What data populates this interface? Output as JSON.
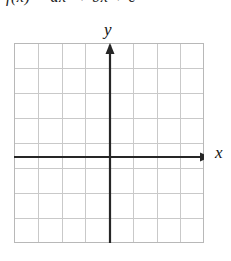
{
  "page": {
    "background_color": "#ffffff",
    "width": 231,
    "height": 261
  },
  "equation_fragment": {
    "text": "f(x) = ax² + bx + c",
    "note_visible": "only the bottom few pixels of this line are visible at the top edge"
  },
  "axes": {
    "y_label": "y",
    "x_label": "x",
    "axis_color": "#262626",
    "origin_x_px": 110,
    "origin_y_px": 157,
    "x_axis_has_arrow": true,
    "y_axis_has_arrow": true
  },
  "chart_data": {
    "type": "scatter",
    "title": "",
    "subtitle": "",
    "xlabel": "x",
    "ylabel": "y",
    "series": [
      {
        "name": "empty",
        "x": [],
        "y": []
      }
    ],
    "xlim": [
      -4,
      4
    ],
    "ylim": [
      -4.5,
      4.5
    ],
    "xticks": [
      -4,
      -3,
      -2,
      -1,
      0,
      1,
      2,
      3,
      4
    ],
    "yticks": [
      -4,
      -3,
      -2,
      -1,
      0,
      1,
      2,
      3,
      4
    ],
    "grid": true,
    "grid_columns": 8,
    "grid_rows": 8,
    "grid_color": "#c9c9c9",
    "grid_border_color": "#b8b8b8",
    "legend": null,
    "legend_position": "none",
    "annotations": [],
    "note": "Blank coordinate grid with no plotted data; axes drawn dark through the grid"
  }
}
